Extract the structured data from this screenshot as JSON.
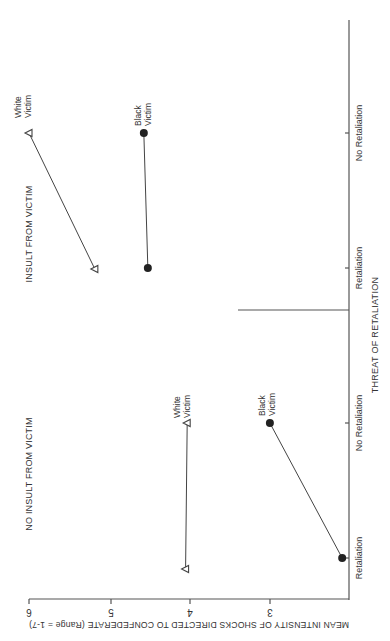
{
  "chart_data": {
    "type": "line",
    "orientation": "rotated 90 degrees clockwise (value axis runs horizontally, category axis vertical)",
    "title": "",
    "ylabel": "MEAN INTENSITY OF SHOCKS DIRECTED TO CONFEDERATE (Range = 1-7)",
    "xlabel": "THREAT OF RETALIATION",
    "yticks": [
      6,
      5,
      4,
      3
    ],
    "ylim": [
      2,
      6
    ],
    "categories": [
      "Retaliation",
      "No Retaliation"
    ],
    "grid": false,
    "panels": [
      {
        "title": "NO INSULT FROM VICTIM",
        "series": [
          {
            "name": "White Victim",
            "marker": "open-triangle",
            "values": [
              4.05,
              4.03
            ]
          },
          {
            "name": "Black Victim",
            "marker": "filled-circle",
            "values": [
              2.1,
              3.0
            ]
          }
        ]
      },
      {
        "title": "INSULT FROM VICTIM",
        "series": [
          {
            "name": "White Victim",
            "marker": "open-triangle",
            "values": [
              5.18,
              6.0
            ]
          },
          {
            "name": "Black Victim",
            "marker": "filled-circle",
            "values": [
              4.52,
              4.57
            ]
          }
        ]
      }
    ]
  },
  "labels": {
    "y_axis_title": "MEAN INTENSITY OF SHOCKS DIRECTED TO CONFEDERATE (Range = 1-7)",
    "x_axis_title": "THREAT OF RETALIATION",
    "panel_no_insult": "NO INSULT FROM VICTIM",
    "panel_insult": "INSULT FROM VICTIM",
    "cat_retaliation": "Retaliation",
    "cat_no_retaliation": "No Retaliation",
    "white_line1": "White",
    "white_line2": "Victim",
    "black_line1": "Black",
    "black_line2": "Victim",
    "tick_6": "6",
    "tick_5": "5",
    "tick_4": "4",
    "tick_3": "3"
  },
  "colors": {
    "axis": "#555555",
    "line": "#444444",
    "text": "#333333",
    "background": "#ffffff"
  }
}
